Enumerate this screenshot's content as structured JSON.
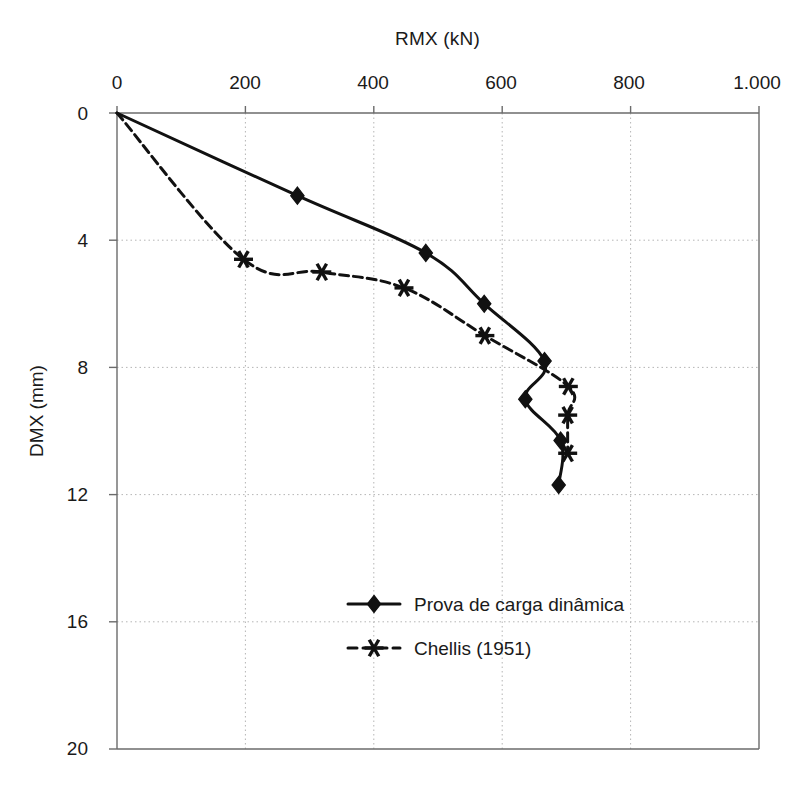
{
  "chart_data": {
    "type": "line",
    "title": "RMX (kN)",
    "xlabel": "RMX (kN)",
    "ylabel": "DMX (mm)",
    "xlim": [
      0,
      1000
    ],
    "ylim": [
      0,
      20
    ],
    "y_axis_inverted": true,
    "grid": true,
    "x_ticks": [
      0,
      200,
      400,
      600,
      800,
      1000
    ],
    "x_tick_labels": [
      "0",
      "200",
      "400",
      "600",
      "800",
      "1.000"
    ],
    "y_ticks": [
      0,
      4,
      8,
      12,
      16,
      20
    ],
    "y_tick_labels": [
      "0",
      "4",
      "8",
      "12",
      "16",
      "20"
    ],
    "legend_position": "inside-lower-center",
    "series": [
      {
        "name": "Prova de carga dinâmica",
        "marker": "diamond",
        "linestyle": "solid",
        "color": "#111111",
        "points": [
          {
            "x": 0,
            "y": 0.0
          },
          {
            "x": 281,
            "y": 2.6
          },
          {
            "x": 481,
            "y": 4.4
          },
          {
            "x": 572,
            "y": 6.0
          },
          {
            "x": 666,
            "y": 7.8
          },
          {
            "x": 636,
            "y": 9.0
          },
          {
            "x": 691,
            "y": 10.3
          },
          {
            "x": 688,
            "y": 11.7
          }
        ]
      },
      {
        "name": "Chellis (1951)",
        "marker": "asterisk",
        "linestyle": "dashed",
        "color": "#111111",
        "points": [
          {
            "x": 0,
            "y": 0.0
          },
          {
            "x": 197,
            "y": 4.6
          },
          {
            "x": 319,
            "y": 5.0
          },
          {
            "x": 447,
            "y": 5.5
          },
          {
            "x": 573,
            "y": 7.0
          },
          {
            "x": 703,
            "y": 8.6
          },
          {
            "x": 702,
            "y": 9.5
          },
          {
            "x": 702,
            "y": 10.7
          }
        ]
      }
    ]
  },
  "legend": {
    "items": [
      {
        "label": "Prova de carga dinâmica",
        "marker": "diamond",
        "linestyle": "solid"
      },
      {
        "label": "Chellis (1951)",
        "marker": "asterisk",
        "linestyle": "dashed"
      }
    ]
  },
  "colors": {
    "ink": "#111111",
    "axis": "#6b6b6b",
    "grid": "#b5b5b5",
    "background": "#ffffff"
  }
}
